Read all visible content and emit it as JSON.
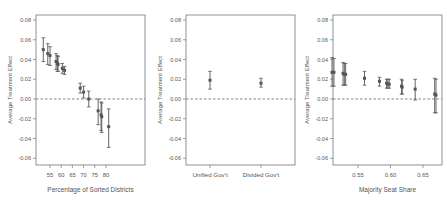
{
  "chart_data": [
    {
      "type": "scatter",
      "subtype": "point-with-error-bars",
      "title": "",
      "xlabel": "Percentage of Sorted Districts",
      "ylabel": "Average Treatment Effect",
      "ylim": [
        -0.065,
        0.085
      ],
      "xlim": [
        51,
        82
      ],
      "xticks": [
        55,
        60,
        65,
        70,
        75,
        80
      ],
      "yticks": [
        -0.06,
        -0.04,
        -0.02,
        0.0,
        0.02,
        0.04,
        0.06,
        0.08
      ],
      "yticklabels": [
        "-0.06",
        "-0.04",
        "-0.02",
        "0.00",
        "0.02",
        "0.04",
        "0.06",
        "0.08"
      ],
      "reference_line": 0.0,
      "grid": false,
      "points": [
        {
          "x": 52.0,
          "y": 0.05,
          "lo": 0.038,
          "hi": 0.062
        },
        {
          "x": 54.0,
          "y": 0.046,
          "lo": 0.035,
          "hi": 0.056
        },
        {
          "x": 55.0,
          "y": 0.044,
          "lo": 0.034,
          "hi": 0.053
        },
        {
          "x": 57.7,
          "y": 0.038,
          "lo": 0.03,
          "hi": 0.046
        },
        {
          "x": 58.3,
          "y": 0.036,
          "lo": 0.028,
          "hi": 0.044
        },
        {
          "x": 58.6,
          "y": 0.035,
          "lo": 0.028,
          "hi": 0.043
        },
        {
          "x": 60.5,
          "y": 0.031,
          "lo": 0.026,
          "hi": 0.036
        },
        {
          "x": 61.5,
          "y": 0.029,
          "lo": 0.025,
          "hi": 0.033
        },
        {
          "x": 68.5,
          "y": 0.011,
          "lo": 0.006,
          "hi": 0.016
        },
        {
          "x": 70.0,
          "y": 0.007,
          "lo": 0.001,
          "hi": 0.013
        },
        {
          "x": 72.3,
          "y": 0.0,
          "lo": -0.008,
          "hi": 0.008
        },
        {
          "x": 76.5,
          "y": -0.012,
          "lo": -0.026,
          "hi": 0.0
        },
        {
          "x": 77.8,
          "y": -0.016,
          "lo": -0.032,
          "hi": -0.003
        },
        {
          "x": 78.1,
          "y": -0.018,
          "lo": -0.034,
          "hi": -0.004
        },
        {
          "x": 81.2,
          "y": -0.028,
          "lo": -0.049,
          "hi": -0.01
        }
      ]
    },
    {
      "type": "scatter",
      "subtype": "point-with-error-bars",
      "title": "",
      "xlabel": "",
      "ylabel": "Average Treatment Effect",
      "ylim": [
        -0.065,
        0.085
      ],
      "categories": [
        "Unified Gov't",
        "Divided Gov't"
      ],
      "yticks": [
        -0.06,
        -0.04,
        -0.02,
        0.0,
        0.02,
        0.04,
        0.06,
        0.08
      ],
      "yticklabels": [
        "-0.06",
        "-0.04",
        "-0.02",
        "0.00",
        "0.02",
        "0.04",
        "0.06",
        "0.08"
      ],
      "reference_line": 0.0,
      "grid": false,
      "points": [
        {
          "x": "Unified Gov't",
          "y": 0.019,
          "lo": 0.01,
          "hi": 0.028
        },
        {
          "x": "Divided Gov't",
          "y": 0.016,
          "lo": 0.012,
          "hi": 0.021
        }
      ]
    },
    {
      "type": "scatter",
      "subtype": "point-with-error-bars",
      "title": "",
      "xlabel": "Majority Seat Share",
      "ylabel": "Average Treatment Effect",
      "ylim": [
        -0.065,
        0.085
      ],
      "xlim": [
        0.505,
        0.675
      ],
      "xticks": [
        0.55,
        0.6,
        0.65
      ],
      "xticklabels": [
        "0.55",
        "0.60",
        "0.65"
      ],
      "yticks": [
        -0.06,
        -0.04,
        -0.02,
        0.0,
        0.02,
        0.04,
        0.06,
        0.08
      ],
      "yticklabels": [
        "-0.06",
        "-0.04",
        "-0.02",
        "0.00",
        "0.02",
        "0.04",
        "0.06",
        "0.08"
      ],
      "reference_line": 0.0,
      "grid": false,
      "points": [
        {
          "x": 0.51,
          "y": 0.027,
          "lo": 0.013,
          "hi": 0.042
        },
        {
          "x": 0.513,
          "y": 0.027,
          "lo": 0.013,
          "hi": 0.041
        },
        {
          "x": 0.527,
          "y": 0.026,
          "lo": 0.014,
          "hi": 0.037
        },
        {
          "x": 0.529,
          "y": 0.025,
          "lo": 0.014,
          "hi": 0.036
        },
        {
          "x": 0.531,
          "y": 0.025,
          "lo": 0.014,
          "hi": 0.036
        },
        {
          "x": 0.56,
          "y": 0.021,
          "lo": 0.014,
          "hi": 0.028
        },
        {
          "x": 0.583,
          "y": 0.018,
          "lo": 0.013,
          "hi": 0.022
        },
        {
          "x": 0.594,
          "y": 0.016,
          "lo": 0.011,
          "hi": 0.02
        },
        {
          "x": 0.596,
          "y": 0.015,
          "lo": 0.011,
          "hi": 0.02
        },
        {
          "x": 0.598,
          "y": 0.015,
          "lo": 0.011,
          "hi": 0.02
        },
        {
          "x": 0.617,
          "y": 0.013,
          "lo": 0.005,
          "hi": 0.02
        },
        {
          "x": 0.618,
          "y": 0.012,
          "lo": 0.005,
          "hi": 0.019
        },
        {
          "x": 0.638,
          "y": 0.01,
          "lo": -0.001,
          "hi": 0.02
        },
        {
          "x": 0.668,
          "y": 0.005,
          "lo": -0.014,
          "hi": 0.021
        },
        {
          "x": 0.67,
          "y": 0.004,
          "lo": -0.014,
          "hi": 0.02
        }
      ]
    }
  ],
  "panels": {
    "left": {
      "xlabel": "Percentage of Sorted Districts",
      "ylabel": "Average Treatment Effect"
    },
    "middle": {
      "ylabel": "Average Treatment Effect",
      "cat1": "Unified Gov't",
      "cat2": "Divided Gov't"
    },
    "right": {
      "xlabel": "Majority Seat Share",
      "ylabel": "Average Treatment Effect"
    }
  },
  "colors": {
    "point": "#555555",
    "errorbar": "#555555",
    "axis": "#777777",
    "refline": "#666666"
  }
}
